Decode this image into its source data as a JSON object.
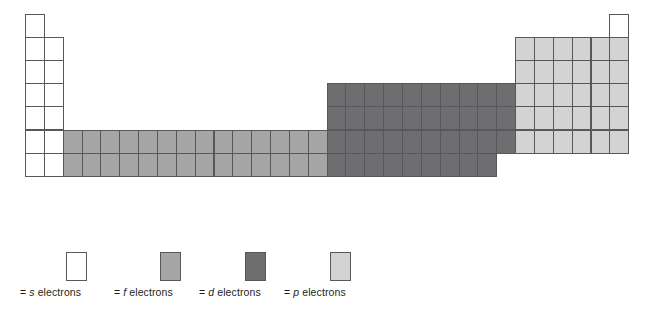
{
  "diagram": {
    "type": "periodic-table-block-map",
    "grid": {
      "rows": 7,
      "columns": 32,
      "origin_x": 25,
      "origin_y": 14,
      "cell_width": 18.85,
      "cell_height": 23.1
    },
    "colors": {
      "s": "#ffffff",
      "f": "#a6a6a6",
      "d": "#6e6e70",
      "p": "#d3d3d3",
      "border": "#58585a",
      "background": "#ffffff",
      "text": "#231f20"
    },
    "blocks": [
      {
        "name": "s-block",
        "orbital": "s",
        "fill": "#ffffff",
        "cells": [
          {
            "col": 1,
            "row": 1
          },
          {
            "col": 1,
            "row": 2
          },
          {
            "col": 2,
            "row": 2
          },
          {
            "col": 1,
            "row": 3
          },
          {
            "col": 2,
            "row": 3
          },
          {
            "col": 1,
            "row": 4
          },
          {
            "col": 2,
            "row": 4
          },
          {
            "col": 1,
            "row": 5
          },
          {
            "col": 2,
            "row": 5
          },
          {
            "col": 1,
            "row": 6
          },
          {
            "col": 2,
            "row": 6
          },
          {
            "col": 1,
            "row": 7
          },
          {
            "col": 2,
            "row": 7
          },
          {
            "col": 32,
            "row": 1
          }
        ]
      },
      {
        "name": "f-block",
        "orbital": "f",
        "fill": "#a6a6a6",
        "cells": [
          {
            "col": 3,
            "row": 6
          },
          {
            "col": 4,
            "row": 6
          },
          {
            "col": 5,
            "row": 6
          },
          {
            "col": 6,
            "row": 6
          },
          {
            "col": 7,
            "row": 6
          },
          {
            "col": 8,
            "row": 6
          },
          {
            "col": 9,
            "row": 6
          },
          {
            "col": 10,
            "row": 6
          },
          {
            "col": 11,
            "row": 6
          },
          {
            "col": 12,
            "row": 6
          },
          {
            "col": 13,
            "row": 6
          },
          {
            "col": 14,
            "row": 6
          },
          {
            "col": 15,
            "row": 6
          },
          {
            "col": 16,
            "row": 6
          },
          {
            "col": 3,
            "row": 7
          },
          {
            "col": 4,
            "row": 7
          },
          {
            "col": 5,
            "row": 7
          },
          {
            "col": 6,
            "row": 7
          },
          {
            "col": 7,
            "row": 7
          },
          {
            "col": 8,
            "row": 7
          },
          {
            "col": 9,
            "row": 7
          },
          {
            "col": 10,
            "row": 7
          },
          {
            "col": 11,
            "row": 7
          },
          {
            "col": 12,
            "row": 7
          },
          {
            "col": 13,
            "row": 7
          },
          {
            "col": 14,
            "row": 7
          },
          {
            "col": 15,
            "row": 7
          },
          {
            "col": 16,
            "row": 7
          }
        ]
      },
      {
        "name": "d-block",
        "orbital": "d",
        "fill": "#6e6e70",
        "cells": [
          {
            "col": 17,
            "row": 4
          },
          {
            "col": 18,
            "row": 4
          },
          {
            "col": 19,
            "row": 4
          },
          {
            "col": 20,
            "row": 4
          },
          {
            "col": 21,
            "row": 4
          },
          {
            "col": 22,
            "row": 4
          },
          {
            "col": 23,
            "row": 4
          },
          {
            "col": 24,
            "row": 4
          },
          {
            "col": 25,
            "row": 4
          },
          {
            "col": 26,
            "row": 4
          },
          {
            "col": 17,
            "row": 5
          },
          {
            "col": 18,
            "row": 5
          },
          {
            "col": 19,
            "row": 5
          },
          {
            "col": 20,
            "row": 5
          },
          {
            "col": 21,
            "row": 5
          },
          {
            "col": 22,
            "row": 5
          },
          {
            "col": 23,
            "row": 5
          },
          {
            "col": 24,
            "row": 5
          },
          {
            "col": 25,
            "row": 5
          },
          {
            "col": 26,
            "row": 5
          },
          {
            "col": 17,
            "row": 6
          },
          {
            "col": 18,
            "row": 6
          },
          {
            "col": 19,
            "row": 6
          },
          {
            "col": 20,
            "row": 6
          },
          {
            "col": 21,
            "row": 6
          },
          {
            "col": 22,
            "row": 6
          },
          {
            "col": 23,
            "row": 6
          },
          {
            "col": 24,
            "row": 6
          },
          {
            "col": 25,
            "row": 6
          },
          {
            "col": 26,
            "row": 6
          },
          {
            "col": 17,
            "row": 7
          },
          {
            "col": 18,
            "row": 7
          },
          {
            "col": 19,
            "row": 7
          },
          {
            "col": 20,
            "row": 7
          },
          {
            "col": 21,
            "row": 7
          },
          {
            "col": 22,
            "row": 7
          },
          {
            "col": 23,
            "row": 7
          },
          {
            "col": 24,
            "row": 7
          },
          {
            "col": 25,
            "row": 7
          }
        ]
      },
      {
        "name": "p-block",
        "orbital": "p",
        "fill": "#d3d3d3",
        "cells": [
          {
            "col": 27,
            "row": 2
          },
          {
            "col": 28,
            "row": 2
          },
          {
            "col": 29,
            "row": 2
          },
          {
            "col": 30,
            "row": 2
          },
          {
            "col": 31,
            "row": 2
          },
          {
            "col": 32,
            "row": 2
          },
          {
            "col": 27,
            "row": 3
          },
          {
            "col": 28,
            "row": 3
          },
          {
            "col": 29,
            "row": 3
          },
          {
            "col": 30,
            "row": 3
          },
          {
            "col": 31,
            "row": 3
          },
          {
            "col": 32,
            "row": 3
          },
          {
            "col": 27,
            "row": 4
          },
          {
            "col": 28,
            "row": 4
          },
          {
            "col": 29,
            "row": 4
          },
          {
            "col": 30,
            "row": 4
          },
          {
            "col": 31,
            "row": 4
          },
          {
            "col": 32,
            "row": 4
          },
          {
            "col": 27,
            "row": 5
          },
          {
            "col": 28,
            "row": 5
          },
          {
            "col": 29,
            "row": 5
          },
          {
            "col": 30,
            "row": 5
          },
          {
            "col": 31,
            "row": 5
          },
          {
            "col": 32,
            "row": 5
          },
          {
            "col": 27,
            "row": 6
          },
          {
            "col": 28,
            "row": 6
          },
          {
            "col": 29,
            "row": 6
          },
          {
            "col": 30,
            "row": 6
          },
          {
            "col": 31,
            "row": 6
          },
          {
            "col": 32,
            "row": 6
          }
        ]
      }
    ]
  },
  "legend": {
    "items": [
      {
        "key": "s",
        "swatch_color": "#ffffff",
        "orbital": "s",
        "prefix": "= ",
        "suffix": " electrons",
        "full_label": "= s electrons",
        "x": 66
      },
      {
        "key": "f",
        "swatch_color": "#a6a6a6",
        "orbital": "f",
        "prefix": "= ",
        "suffix": " electrons",
        "full_label": "= f electrons",
        "x": 160
      },
      {
        "key": "d",
        "swatch_color": "#6e6e70",
        "orbital": "d",
        "prefix": "= ",
        "suffix": " electrons",
        "full_label": "= d electrons",
        "x": 245
      },
      {
        "key": "p",
        "swatch_color": "#d3d3d3",
        "orbital": "p",
        "prefix": "= ",
        "suffix": " electrons",
        "full_label": "= p electrons",
        "x": 330
      }
    ]
  }
}
